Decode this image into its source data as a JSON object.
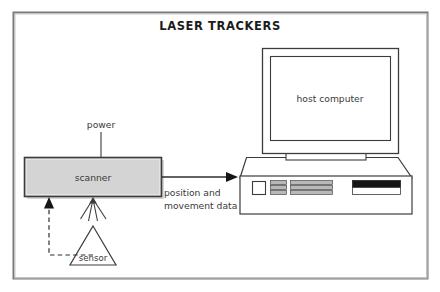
{
  "figure": {
    "title": "LASER TRACKERS",
    "border_color": "#6b6b6b",
    "background": "#ffffff"
  },
  "nodes": {
    "scanner": {
      "label": "scanner",
      "fill": "#d4d4d4",
      "stroke": "#3c3c3c"
    },
    "host_computer": {
      "label": "host computer",
      "fill": "#ffffff",
      "stroke": "#3c3c3c"
    },
    "sensor": {
      "label": "sensor",
      "fill": "#ffffff",
      "stroke": "#3c3c3c"
    }
  },
  "connections": {
    "power": {
      "label": "power",
      "style": "solid"
    },
    "data": {
      "label_line1": "position and",
      "label_line2": "movement data",
      "style": "solid-arrow"
    },
    "feedback": {
      "style": "dashed-arrow"
    },
    "laser_beams": {
      "count": 4,
      "style": "solid"
    }
  },
  "colors": {
    "line": "#3c3c3c",
    "text": "#3a3a3a",
    "title": "#1c1c1c",
    "panel_gray": "#b8b8b8",
    "drive_dark": "#151515",
    "shadow": "#b0b0b0"
  }
}
